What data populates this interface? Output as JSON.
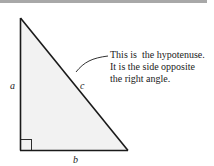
{
  "diagram": {
    "labels": {
      "a": "a",
      "b": "b",
      "c": "c"
    },
    "annotation": {
      "lines": [
        "This is  the hypotenuse.",
        "It is the side opposite",
        "the right angle."
      ]
    },
    "colors": {
      "fill": "#f2f2f2",
      "stroke": "#1a1a1a",
      "topbar": "#a8a8a8"
    }
  }
}
